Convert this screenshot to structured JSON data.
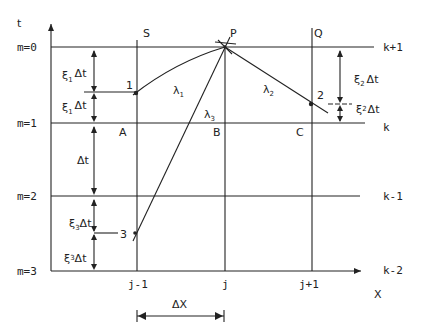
{
  "axes": {
    "y_label": "t",
    "x_label": "X"
  },
  "time_levels": [
    {
      "m_label": "m=0",
      "k_label": "k+1"
    },
    {
      "m_label": "m=1",
      "k_label": "k"
    },
    {
      "m_label": "m=2",
      "k_label": "k-1"
    },
    {
      "m_label": "m=3",
      "k_label": "k-2"
    }
  ],
  "grid_columns": [
    {
      "label": "j-1",
      "top_label": "S"
    },
    {
      "label": "j",
      "top_label": ""
    },
    {
      "label": "j+1",
      "top_label": "Q"
    }
  ],
  "points": {
    "P": "P",
    "A": "A",
    "B": "B",
    "C": "C",
    "p1": "1",
    "p2": "2",
    "p3": "3"
  },
  "characteristics": {
    "lambda1": {
      "base": "λ",
      "sub": "1"
    },
    "lambda2": {
      "base": "λ",
      "sub": "2"
    },
    "lambda3": {
      "base": "λ",
      "sub": "3"
    }
  },
  "dimensions": {
    "xi1_dt": {
      "base": "ξ",
      "sub": "1",
      "tail": "Δt"
    },
    "xi1p_dt": {
      "base": "ξ",
      "sub": "1",
      "sup": "'",
      "tail": "Δt"
    },
    "dt": "Δt",
    "xi3_dt": {
      "base": "ξ",
      "sub": "3",
      "tail": "Δt"
    },
    "xi3p_dt": {
      "base": "ξ",
      "sub": "3",
      "sup": "'",
      "tail": "Δt"
    },
    "xi2_dt": {
      "base": "ξ",
      "sub": "2",
      "tail": "Δt"
    },
    "xi2p_dt": {
      "base": "ξ",
      "sub": "2",
      "sup": "'",
      "tail": "Δt"
    },
    "dx": "ΔX"
  },
  "colors": {
    "line": "#222222",
    "background": "#ffffff"
  }
}
